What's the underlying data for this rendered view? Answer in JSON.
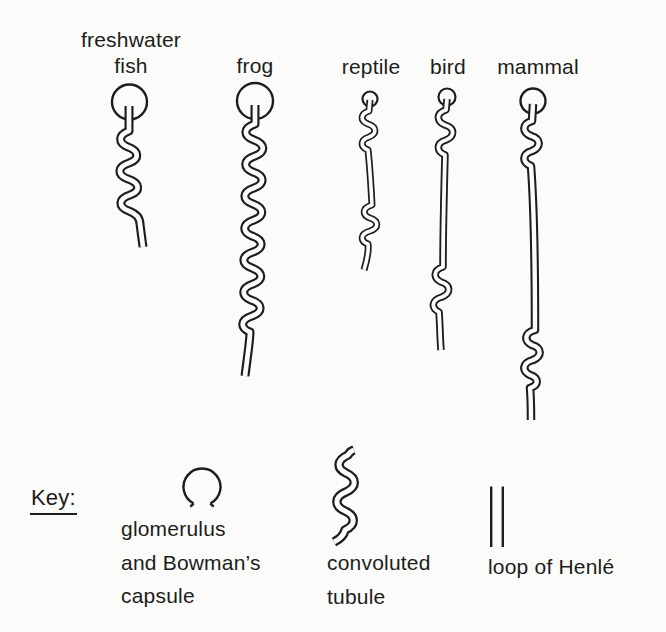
{
  "diagram": {
    "organisms": [
      {
        "label": "freshwater fish",
        "glomerulus": "large",
        "convoluted_tubule": "short",
        "loop_of_henle": "absent"
      },
      {
        "label": "frog",
        "glomerulus": "large",
        "convoluted_tubule": "long",
        "loop_of_henle": "absent"
      },
      {
        "label": "reptile",
        "glomerulus": "small",
        "convoluted_tubule": "short",
        "loop_of_henle": "short"
      },
      {
        "label": "bird",
        "glomerulus": "small",
        "convoluted_tubule": "short",
        "loop_of_henle": "long"
      },
      {
        "label": "mammal",
        "glomerulus": "medium",
        "convoluted_tubule": "short",
        "loop_of_henle": "very long"
      }
    ],
    "key": {
      "heading": "Key:",
      "items": [
        {
          "symbol": "glomerulus-capsule-circle",
          "lines": [
            "glomerulus",
            "and Bowman’s",
            "capsule"
          ]
        },
        {
          "symbol": "convoluted-tubule-wavy-lines",
          "lines": [
            "convoluted",
            "tubule"
          ]
        },
        {
          "symbol": "loop-of-henle-parallel-lines",
          "lines": [
            "loop of Henlé"
          ]
        }
      ]
    }
  },
  "colors": {
    "ink": "#1d1d1b",
    "paper": "#fbfbf9"
  }
}
